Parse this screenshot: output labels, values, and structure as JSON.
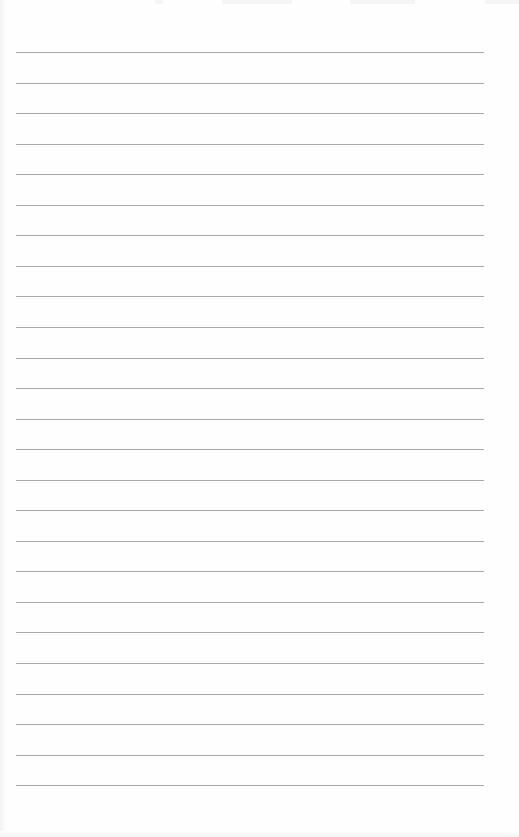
{
  "page": {
    "type": "lined-paper",
    "background": "#fefefe",
    "rule_color": "#a9a9a9",
    "rule_count": 25,
    "first_rule_y": 52,
    "rule_spacing": 30.55,
    "rule_left": 16,
    "rule_width": 468
  }
}
